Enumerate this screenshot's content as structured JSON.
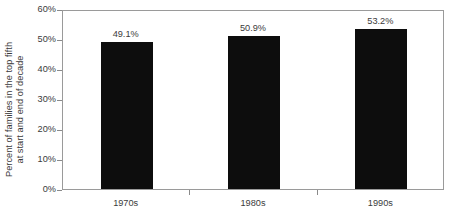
{
  "chart_data": {
    "type": "bar",
    "title": "",
    "subtitle": "",
    "xlabel": "",
    "ylabel": "Percent of families in the top fifth at start and end of decade",
    "ylabel_lines": [
      "Percent of families in the top fifth",
      "at start and end of decade"
    ],
    "categories": [
      "1970s",
      "1980s",
      "1990s"
    ],
    "values": [
      49.1,
      50.9,
      53.2
    ],
    "data_labels": [
      "49.1%",
      "50.9%",
      "53.2%"
    ],
    "ylim": [
      0,
      60
    ],
    "ytick_values": [
      0,
      10,
      20,
      30,
      40,
      50,
      60
    ],
    "ytick_labels": [
      "0%",
      "10%",
      "20%",
      "30%",
      "40%",
      "50%",
      "60%"
    ],
    "grid": false,
    "legend": null,
    "legend_position": "none",
    "bar_color": "#0d0d0d",
    "axis_color": "#9a9a9a",
    "text_color": "#3b3b3b",
    "background": "#ffffff"
  }
}
